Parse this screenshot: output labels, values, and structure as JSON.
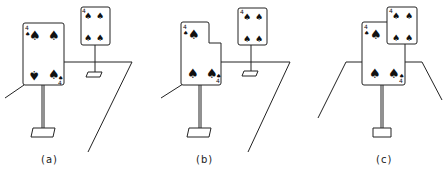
{
  "figure": {
    "panels": [
      {
        "id": "a",
        "caption": "(a)"
      },
      {
        "id": "b",
        "caption": "(b)"
      },
      {
        "id": "c",
        "caption": "(c)"
      }
    ],
    "near_card": {
      "rank": "4",
      "suit": "spade",
      "glyph": "♠"
    },
    "far_card": {
      "rank": "4",
      "suit": "spade",
      "glyph": "♠"
    },
    "line_color": "#222222",
    "background": "#ffffff"
  }
}
